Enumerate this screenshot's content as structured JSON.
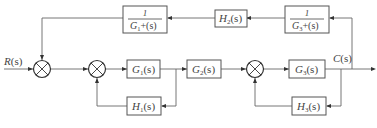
{
  "diagram": {
    "type": "control-system-block-diagram",
    "input": {
      "label": "R(s)",
      "name": "R",
      "arg": "(s)"
    },
    "output": {
      "label": "C(s)",
      "name": "C",
      "arg": "(s)"
    },
    "blocks": {
      "G1": {
        "label": "G",
        "sub": "1",
        "arg": "(s)"
      },
      "G2": {
        "label": "G",
        "sub": "2",
        "arg": "(s)"
      },
      "G3": {
        "label": "G",
        "sub": "3",
        "arg": "(s)"
      },
      "H1": {
        "label": "H",
        "sub": "1",
        "arg": "(s)"
      },
      "H2": {
        "label": "H",
        "sub": "2",
        "arg": "(s)"
      },
      "H3": {
        "label": "H",
        "sub": "3",
        "arg": "(s)"
      },
      "invG1": {
        "numerator": "1",
        "den_label": "G",
        "den_sub": "1",
        "den_arg": "+(s)"
      },
      "invG3": {
        "numerator": "1",
        "den_label": "G",
        "den_sub": "3",
        "den_arg": "+(s)"
      }
    },
    "summing_junctions": [
      "S1",
      "S2",
      "S3"
    ],
    "connections": [
      "R(s) -> S1",
      "S1 -> S2",
      "S2 -> G1(s)",
      "G1(s) -> G2(s)",
      "G2(s) -> S3",
      "S3 -> G3(s)",
      "G3(s) -> C(s)",
      "G1 output -> H1(s) -> S2",
      "C(s) -> H3(s) -> S3",
      "C(s) -> 1/G3+(s) -> H2(s) -> 1/G1+(s) -> S1"
    ]
  }
}
